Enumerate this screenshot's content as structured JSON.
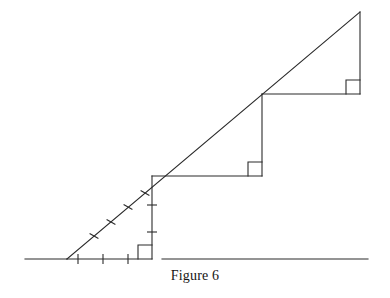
{
  "figure": {
    "caption": "Figure 6",
    "title": "Figure 6",
    "colors": {
      "stroke": "#2b2b2b",
      "background": "#ffffff",
      "caption_text": "#151515"
    },
    "stroke_width": 1.1,
    "canvas": {
      "width": 390,
      "height": 298
    }
  },
  "geometry": {
    "baseline": {
      "label": "horizontal baseline",
      "y": 259,
      "left_segment": {
        "x1": 25,
        "x2": 67
      },
      "triangle_segment": {
        "x1": 67,
        "x2": 152
      },
      "right_segment": {
        "x1": 162,
        "x2": 368
      }
    },
    "ray": {
      "label": "slanted ray",
      "x1": 67,
      "y1": 259,
      "x2": 360,
      "y2": 12
    },
    "vertex": {
      "x": 67,
      "y": 259
    },
    "apex": {
      "x": 360,
      "y": 12
    },
    "verticals": [
      {
        "name": "first-vertical",
        "x": 152,
        "y_top": 176,
        "y_bottom": 259
      },
      {
        "name": "second-vertical",
        "x": 262,
        "y_top": 94,
        "y_bottom": 176
      },
      {
        "name": "third-vertical",
        "x": 360,
        "y_top": 12,
        "y_bottom": 94
      }
    ],
    "horizontals": [
      {
        "name": "second-horizontal",
        "y": 176,
        "x1": 152,
        "x2": 262
      },
      {
        "name": "third-horizontal",
        "y": 94,
        "x1": 262,
        "x2": 360
      }
    ],
    "right_angle_squares": [
      {
        "name": "right-angle-square-1",
        "corner_x": 152,
        "corner_y": 259,
        "size": 14,
        "dir_x": -1,
        "dir_y": -1
      },
      {
        "name": "right-angle-square-2",
        "corner_x": 262,
        "corner_y": 176,
        "size": 14,
        "dir_x": -1,
        "dir_y": -1
      },
      {
        "name": "right-angle-square-3",
        "corner_x": 360,
        "corner_y": 94,
        "size": 14,
        "dir_x": -1,
        "dir_y": -1
      }
    ],
    "tick_marks": {
      "baseline_ticks": {
        "count": 3,
        "length": 9,
        "positions_x": [
          78,
          103,
          128
        ],
        "y": 259
      },
      "ray_ticks": {
        "count": 4,
        "length": 9,
        "points": [
          {
            "x": 94,
            "y": 236
          },
          {
            "x": 111,
            "y": 222
          },
          {
            "x": 128,
            "y": 207
          },
          {
            "x": 145,
            "y": 193
          }
        ]
      },
      "vertical_ticks": {
        "count": 2,
        "length": 9,
        "x": 152,
        "positions_y": [
          205,
          232
        ]
      }
    }
  }
}
